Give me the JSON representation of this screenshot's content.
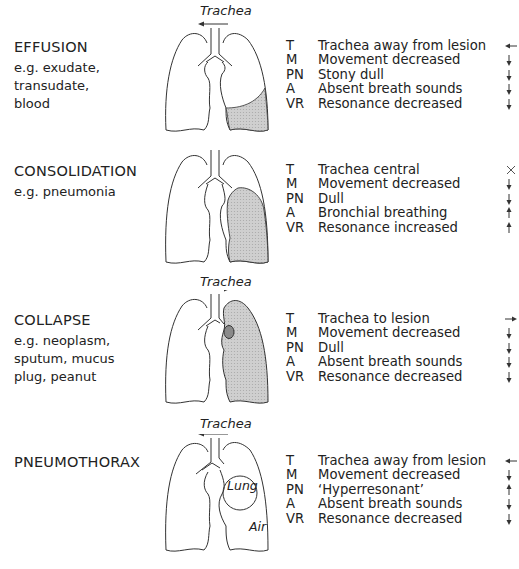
{
  "diagram": {
    "type": "clinical signs of lung pathology",
    "legend_abbreviations": [
      "T",
      "M",
      "PN",
      "A",
      "VR"
    ]
  },
  "panels": [
    {
      "title": "EFFUSION",
      "examples": [
        "e.g. exudate,",
        "transudate,",
        "blood"
      ],
      "trachea_label": "Trachea",
      "trachea_arrow": "left",
      "lesion": "right lower zone shaded (fluid)",
      "signs": [
        {
          "abbr": "T",
          "text": "Trachea away from lesion",
          "arrow": "left"
        },
        {
          "abbr": "M",
          "text": "Movement decreased",
          "arrow": "down"
        },
        {
          "abbr": "PN",
          "text": "Stony dull",
          "arrow": "down"
        },
        {
          "abbr": "A",
          "text": "Absent breath sounds",
          "arrow": "down"
        },
        {
          "abbr": "VR",
          "text": "Resonance decreased",
          "arrow": "down"
        }
      ]
    },
    {
      "title": "CONSOLIDATION",
      "examples": [
        "e.g. pneumonia"
      ],
      "trachea_label": "",
      "trachea_arrow": "none",
      "lesion": "right lung lobe shaded",
      "signs": [
        {
          "abbr": "T",
          "text": "Trachea central",
          "arrow": "cross"
        },
        {
          "abbr": "M",
          "text": "Movement decreased",
          "arrow": "down"
        },
        {
          "abbr": "PN",
          "text": "Dull",
          "arrow": "down"
        },
        {
          "abbr": "A",
          "text": "Bronchial breathing",
          "arrow": "up"
        },
        {
          "abbr": "VR",
          "text": "Resonance increased",
          "arrow": "up"
        }
      ]
    },
    {
      "title": "COLLAPSE",
      "examples": [
        "e.g. neoplasm,",
        "sputum, mucus",
        "plug, peanut"
      ],
      "trachea_label": "Trachea",
      "trachea_arrow": "right",
      "lesion": "whole right lung shaded with obstructing mass",
      "signs": [
        {
          "abbr": "T",
          "text": "Trachea to lesion",
          "arrow": "right"
        },
        {
          "abbr": "M",
          "text": "Movement decreased",
          "arrow": "down"
        },
        {
          "abbr": "PN",
          "text": "Dull",
          "arrow": "down"
        },
        {
          "abbr": "A",
          "text": "Absent breath sounds",
          "arrow": "down"
        },
        {
          "abbr": "VR",
          "text": "Resonance decreased",
          "arrow": "down"
        }
      ]
    },
    {
      "title": "PNEUMOTHORAX",
      "examples": [],
      "trachea_label": "Trachea",
      "trachea_arrow": "left",
      "lesion": "collapsed lung surrounded by air",
      "inner_labels": {
        "lung": "Lung",
        "air": "Air"
      },
      "signs": [
        {
          "abbr": "T",
          "text": "Trachea away from lesion",
          "arrow": "left"
        },
        {
          "abbr": "M",
          "text": "Movement decreased",
          "arrow": "down"
        },
        {
          "abbr": "PN",
          "text": "‘Hyperresonant’",
          "arrow": "up"
        },
        {
          "abbr": "A",
          "text": "Absent breath sounds",
          "arrow": "down"
        },
        {
          "abbr": "VR",
          "text": "Resonance decreased",
          "arrow": "down"
        }
      ]
    }
  ],
  "colors": {
    "outline": "#333333",
    "shading": "#c8c8c8",
    "mass": "#8a8a8a",
    "text": "#222222"
  }
}
